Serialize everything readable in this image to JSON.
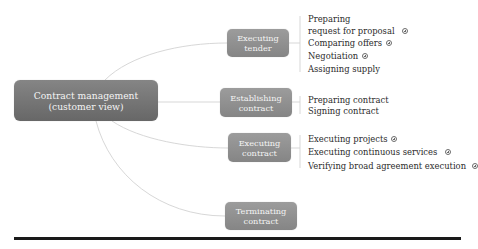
{
  "diagram": {
    "type": "mind-map",
    "root": {
      "label_line1": "Contract management",
      "label_line2": "(customer view)"
    },
    "branches": [
      {
        "label_line1": "Executing",
        "label_line2": "tender",
        "children": [
          {
            "label": "Preparing",
            "expandable": false
          },
          {
            "label": "request for proposal",
            "expandable": true
          },
          {
            "label": "Comparing offers",
            "expandable": true
          },
          {
            "label": "Negotiation",
            "expandable": true
          },
          {
            "label": "Assigning supply",
            "expandable": false
          }
        ]
      },
      {
        "label_line1": "Establishing",
        "label_line2": "contract",
        "children": [
          {
            "label": "Preparing contract",
            "expandable": false
          },
          {
            "label": "Signing contract",
            "expandable": false
          }
        ]
      },
      {
        "label_line1": "Executing",
        "label_line2": "contract",
        "children": [
          {
            "label": "Executing projects",
            "expandable": true
          },
          {
            "label": "Executing continuous services",
            "expandable": true
          },
          {
            "label": "Verifying broad agreement execution",
            "expandable": true
          }
        ]
      },
      {
        "label_line1": "Terminating",
        "label_line2": "contract",
        "children": []
      }
    ],
    "icons": {
      "expand": "circled-plus-icon"
    },
    "colors": {
      "root_fill": "#767676",
      "branch_fill": "#8f8f8f",
      "node_text": "#f4f4f4",
      "leaf_text": "#2b2b2b",
      "connector": "#d0d0d0",
      "rule": "#1a1a1a"
    }
  }
}
